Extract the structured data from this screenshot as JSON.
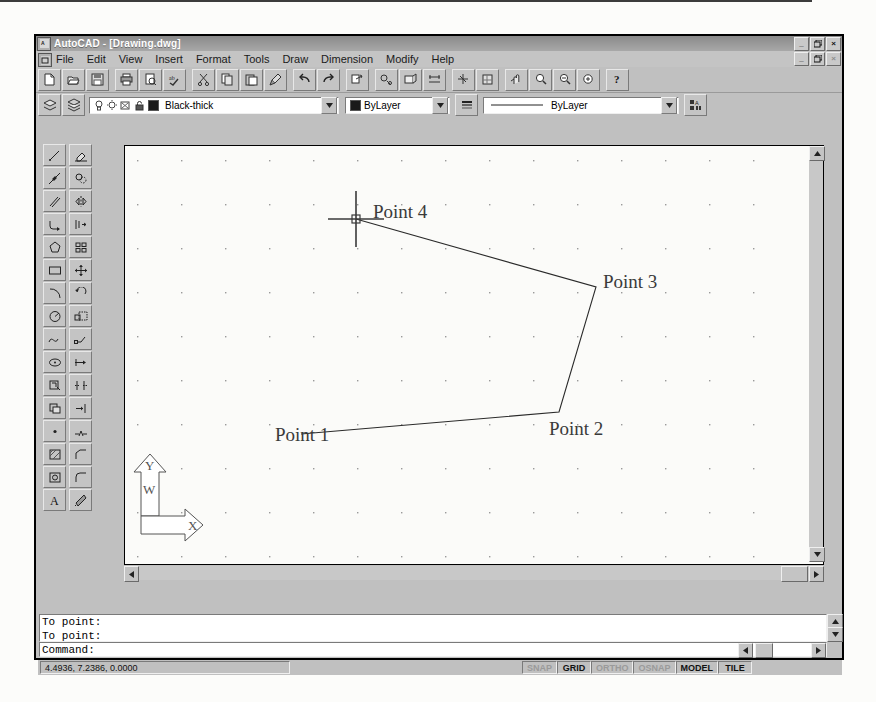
{
  "window": {
    "app_title": "AutoCAD - [Drawing.dwg]",
    "app_icon": "autocad-icon",
    "doc_icon": "document-icon",
    "minimize_label": "_",
    "restore_label": "❐",
    "close_label": "×"
  },
  "menu": {
    "items": [
      {
        "label": "File",
        "accel": "F"
      },
      {
        "label": "Edit",
        "accel": "E"
      },
      {
        "label": "View",
        "accel": "V"
      },
      {
        "label": "Insert",
        "accel": "I"
      },
      {
        "label": "Format",
        "accel": "o"
      },
      {
        "label": "Tools",
        "accel": "T"
      },
      {
        "label": "Draw",
        "accel": "D"
      },
      {
        "label": "Dimension",
        "accel": "n"
      },
      {
        "label": "Modify",
        "accel": "M"
      },
      {
        "label": "Help",
        "accel": "H"
      }
    ]
  },
  "standard_toolbar": {
    "buttons": [
      {
        "name": "new-button",
        "icon": "new-file-icon"
      },
      {
        "name": "open-button",
        "icon": "open-folder-icon"
      },
      {
        "name": "save-button",
        "icon": "floppy-disk-icon"
      },
      {
        "name": "print-button",
        "icon": "printer-icon"
      },
      {
        "name": "print-preview-button",
        "icon": "print-preview-icon"
      },
      {
        "name": "spelling-button",
        "icon": "spell-check-icon"
      },
      {
        "name": "cut-button",
        "icon": "scissors-icon"
      },
      {
        "name": "copy-button",
        "icon": "copy-icon"
      },
      {
        "name": "paste-button",
        "icon": "clipboard-paste-icon"
      },
      {
        "name": "match-properties-button",
        "icon": "paintbrush-icon"
      },
      {
        "name": "undo-button",
        "icon": "undo-arrow-icon"
      },
      {
        "name": "redo-button",
        "icon": "redo-arrow-icon"
      },
      {
        "name": "external-reference-button",
        "icon": "xref-icon"
      },
      {
        "name": "object-snap-button",
        "icon": "osnap-icon"
      },
      {
        "name": "ucs-button",
        "icon": "ucs-icon"
      },
      {
        "name": "distance-button",
        "icon": "measure-icon"
      },
      {
        "name": "linear-dimension-button",
        "icon": "dimension-icon"
      },
      {
        "name": "redraw-button",
        "icon": "redraw-icon"
      },
      {
        "name": "aerial-view-button",
        "icon": "aerial-view-icon"
      },
      {
        "name": "named-views-button",
        "icon": "named-views-icon"
      },
      {
        "name": "pan-realtime-button",
        "icon": "pan-hand-icon"
      },
      {
        "name": "zoom-realtime-button",
        "icon": "zoom-magnifier-icon"
      },
      {
        "name": "zoom-window-button",
        "icon": "zoom-window-icon"
      },
      {
        "name": "zoom-previous-button",
        "icon": "zoom-previous-icon"
      },
      {
        "name": "help-button",
        "icon": "question-mark-icon"
      }
    ]
  },
  "object_properties_toolbar": {
    "layers_button": {
      "name": "layers-button",
      "icon": "layers-icon"
    },
    "layer_states_button": {
      "name": "layer-states-button",
      "icon": "layer-stack-icon"
    },
    "layer_state_icons": [
      {
        "name": "layer-on-icon",
        "icon": "lightbulb-icon"
      },
      {
        "name": "layer-freeze-icon",
        "icon": "sun-icon"
      },
      {
        "name": "layer-freeze-viewport-icon",
        "icon": "snowflake-viewport-icon"
      },
      {
        "name": "layer-lock-icon",
        "icon": "padlock-icon"
      },
      {
        "name": "layer-color-swatch",
        "icon": "color-swatch-icon"
      }
    ],
    "layer_value": "Black-thick",
    "color_value": "ByLayer",
    "linetype_value": "ByLayer",
    "lineweight_button": {
      "name": "lineweight-button",
      "icon": "lineweight-icon"
    },
    "properties_button": {
      "name": "properties-button",
      "icon": "properties-icon"
    }
  },
  "draw_toolbar": {
    "title": "Draw",
    "buttons": [
      {
        "name": "line-tool",
        "icon": "line-icon"
      },
      {
        "name": "construction-line-tool",
        "icon": "construction-line-icon"
      },
      {
        "name": "multiline-tool",
        "icon": "multiline-icon"
      },
      {
        "name": "polyline-tool",
        "icon": "polyline-icon"
      },
      {
        "name": "polygon-tool",
        "icon": "polygon-icon"
      },
      {
        "name": "rectangle-tool",
        "icon": "rectangle-icon"
      },
      {
        "name": "arc-tool",
        "icon": "arc-icon"
      },
      {
        "name": "circle-tool",
        "icon": "circle-icon"
      },
      {
        "name": "spline-tool",
        "icon": "spline-icon"
      },
      {
        "name": "ellipse-tool",
        "icon": "ellipse-icon"
      },
      {
        "name": "insert-block-tool",
        "icon": "insert-block-icon"
      },
      {
        "name": "make-block-tool",
        "icon": "make-block-icon"
      },
      {
        "name": "point-tool",
        "icon": "point-icon"
      },
      {
        "name": "hatch-tool",
        "icon": "hatch-icon"
      },
      {
        "name": "region-tool",
        "icon": "region-icon"
      },
      {
        "name": "multiline-text-tool",
        "icon": "text-a-icon"
      }
    ]
  },
  "modify_toolbar": {
    "title": "Modify",
    "buttons": [
      {
        "name": "erase-tool",
        "icon": "eraser-icon"
      },
      {
        "name": "copy-object-tool",
        "icon": "copy-object-icon"
      },
      {
        "name": "mirror-tool",
        "icon": "mirror-icon"
      },
      {
        "name": "offset-tool",
        "icon": "offset-icon"
      },
      {
        "name": "array-tool",
        "icon": "array-grid-icon"
      },
      {
        "name": "move-tool",
        "icon": "move-cross-icon"
      },
      {
        "name": "rotate-tool",
        "icon": "rotate-icon"
      },
      {
        "name": "scale-tool",
        "icon": "scale-icon"
      },
      {
        "name": "stretch-tool",
        "icon": "stretch-icon"
      },
      {
        "name": "lengthen-tool",
        "icon": "lengthen-icon"
      },
      {
        "name": "trim-tool",
        "icon": "trim-icon"
      },
      {
        "name": "extend-tool",
        "icon": "extend-icon"
      },
      {
        "name": "break-tool",
        "icon": "break-icon"
      },
      {
        "name": "chamfer-tool",
        "icon": "chamfer-icon"
      },
      {
        "name": "fillet-tool",
        "icon": "fillet-icon"
      },
      {
        "name": "explode-tool",
        "icon": "explode-icon"
      }
    ]
  },
  "drawing": {
    "grid_visible": true,
    "grid_spacing_px": 44,
    "polyline_points": [
      {
        "label": "Point 1",
        "x": 176,
        "y": 288
      },
      {
        "label": "Point 2",
        "x": 434,
        "y": 266
      },
      {
        "label": "Point 3",
        "x": 471,
        "y": 141
      },
      {
        "label": "Point 4",
        "x": 231,
        "y": 73
      }
    ],
    "labels": [
      {
        "text": "Point 1",
        "left": 150,
        "top": 278
      },
      {
        "text": "Point 2",
        "left": 424,
        "top": 272
      },
      {
        "text": "Point 3",
        "left": 478,
        "top": 125
      },
      {
        "text": "Point 4",
        "left": 248,
        "top": 55
      }
    ],
    "cursor": {
      "name": "crosshair-cursor",
      "x": 231,
      "y": 73
    },
    "ucs_icon": {
      "name": "ucs-world-icon",
      "x_label": "X",
      "y_label": "Y",
      "world_label": "W"
    }
  },
  "command_window": {
    "history": [
      "To point:",
      "To point:"
    ],
    "prompt": "Command:"
  },
  "status_bar": {
    "coordinates": "4.4936, 7.2386, 0.0000",
    "toggles": [
      {
        "label": "SNAP",
        "active": false
      },
      {
        "label": "GRID",
        "active": true
      },
      {
        "label": "ORTHO",
        "active": false
      },
      {
        "label": "OSNAP",
        "active": false
      },
      {
        "label": "MODEL",
        "active": true
      },
      {
        "label": "TILE",
        "active": true
      }
    ]
  }
}
